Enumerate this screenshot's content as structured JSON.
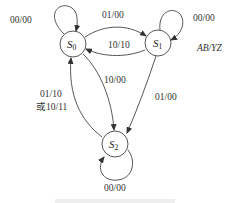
{
  "diagram": {
    "type": "state-transition",
    "legend": "AB/YZ",
    "states": [
      {
        "id": "S0",
        "name": "S",
        "sub": "0"
      },
      {
        "id": "S1",
        "name": "S",
        "sub": "1"
      },
      {
        "id": "S2",
        "name": "S",
        "sub": "2"
      }
    ],
    "transitions": [
      {
        "from": "S0",
        "to": "S0",
        "label": "00/00"
      },
      {
        "from": "S0",
        "to": "S1",
        "label": "01/00"
      },
      {
        "from": "S1",
        "to": "S0",
        "label": "10/10"
      },
      {
        "from": "S1",
        "to": "S1",
        "label": "00/00"
      },
      {
        "from": "S0",
        "to": "S2",
        "label": "10/00"
      },
      {
        "from": "S1",
        "to": "S2",
        "label": "01/00"
      },
      {
        "from": "S2",
        "to": "S0",
        "label": "01/10",
        "label2": "或10/11"
      },
      {
        "from": "S2",
        "to": "S2",
        "label": "00/00"
      }
    ]
  }
}
